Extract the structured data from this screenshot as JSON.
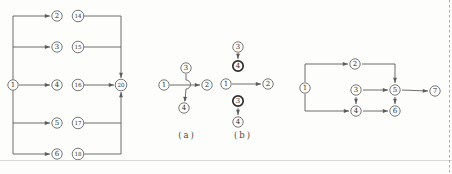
{
  "figure": {
    "width": 452,
    "height": 174,
    "bg": "#fdfdfc",
    "ink": "#5c5c5c",
    "node_stroke": "#6a6a6a",
    "bold_stroke": "#2e2e2e",
    "node_fill": "#fdfdfc",
    "text_color": "#333333",
    "rule_color": "#d8d8d8",
    "dash_color": "#a8a8a8"
  },
  "labels": {
    "a": "(a)",
    "b": "(b)"
  },
  "diagrams": {
    "fan": {
      "nodes": [
        {
          "label": "1",
          "x": 13,
          "y": 85
        },
        {
          "label": "2",
          "x": 57,
          "y": 16
        },
        {
          "label": "3",
          "x": 57,
          "y": 47
        },
        {
          "label": "4",
          "x": 57,
          "y": 85
        },
        {
          "label": "5",
          "x": 57,
          "y": 123
        },
        {
          "label": "6",
          "x": 57,
          "y": 154
        },
        {
          "label": "14",
          "x": 78,
          "y": 16
        },
        {
          "label": "15",
          "x": 78,
          "y": 47
        },
        {
          "label": "16",
          "x": 78,
          "y": 85
        },
        {
          "label": "17",
          "x": 78,
          "y": 123
        },
        {
          "label": "18",
          "x": 78,
          "y": 154
        },
        {
          "label": "20",
          "x": 121,
          "y": 85
        }
      ],
      "edges": [
        {
          "points": [
            [
              13,
              16
            ],
            [
              13,
              154
            ]
          ]
        },
        {
          "points": [
            [
              13,
              16
            ],
            [
              50,
              16
            ]
          ],
          "arrow": true
        },
        {
          "points": [
            [
              13,
              47
            ],
            [
              50,
              47
            ]
          ],
          "arrow": true
        },
        {
          "points": [
            [
              19,
              85
            ],
            [
              50,
              85
            ]
          ],
          "arrow": true
        },
        {
          "points": [
            [
              13,
              123
            ],
            [
              50,
              123
            ]
          ],
          "arrow": true
        },
        {
          "points": [
            [
              13,
              154
            ],
            [
              50,
              154
            ]
          ],
          "arrow": true
        },
        {
          "points": [
            [
              84,
              16
            ],
            [
              121,
              16
            ],
            [
              121,
              78
            ]
          ],
          "arrow": true
        },
        {
          "points": [
            [
              84,
              47
            ],
            [
              121,
              47
            ]
          ]
        },
        {
          "points": [
            [
              84,
              85
            ],
            [
              114,
              85
            ]
          ],
          "arrow": true
        },
        {
          "points": [
            [
              84,
              123
            ],
            [
              121,
              123
            ]
          ]
        },
        {
          "points": [
            [
              84,
              154
            ],
            [
              121,
              154
            ],
            [
              121,
              92
            ]
          ],
          "arrow": true
        }
      ]
    },
    "cross_a": {
      "nodes": [
        {
          "label": "1",
          "x": 164,
          "y": 85
        },
        {
          "label": "2",
          "x": 207,
          "y": 85
        },
        {
          "label": "3",
          "x": 186,
          "y": 68
        },
        {
          "label": "4",
          "x": 184,
          "y": 108
        }
      ],
      "edges": [
        {
          "points": [
            [
              170,
              85
            ],
            [
              200,
              85
            ]
          ],
          "arrow": true
        },
        {
          "d": "M186,74 L186,80 A4.5,4.5 0 0 1 186,89 L185,101",
          "arrow": {
            "x": 184.8,
            "y": 102,
            "angle": 93
          }
        }
      ]
    },
    "cross_b": {
      "nodes": [
        {
          "label": "3",
          "x": 238,
          "y": 47
        },
        {
          "label": "4",
          "x": 238,
          "y": 66,
          "bold": true
        },
        {
          "label": "1",
          "x": 226,
          "y": 84
        },
        {
          "label": "2",
          "x": 268,
          "y": 84
        },
        {
          "label": "3",
          "x": 238,
          "y": 101,
          "bold": true
        },
        {
          "label": "4",
          "x": 238,
          "y": 122
        }
      ],
      "edges": [
        {
          "points": [
            [
              238,
              53
            ],
            [
              238,
              59
            ]
          ],
          "arrow": true
        },
        {
          "points": [
            [
              232,
              84
            ],
            [
              261,
              84
            ]
          ],
          "arrow": true
        },
        {
          "points": [
            [
              238,
              108
            ],
            [
              238,
              115
            ]
          ],
          "arrow": true
        }
      ]
    },
    "network": {
      "nodes": [
        {
          "label": "1",
          "x": 305,
          "y": 88
        },
        {
          "label": "2",
          "x": 355,
          "y": 64
        },
        {
          "label": "3",
          "x": 356,
          "y": 90
        },
        {
          "label": "4",
          "x": 356,
          "y": 111
        },
        {
          "label": "5",
          "x": 395,
          "y": 90
        },
        {
          "label": "6",
          "x": 395,
          "y": 111
        },
        {
          "label": "7",
          "x": 435,
          "y": 91
        }
      ],
      "edges": [
        {
          "points": [
            [
              305,
              82
            ],
            [
              305,
              64
            ],
            [
              348,
              64
            ]
          ],
          "arrow": true
        },
        {
          "points": [
            [
              362,
              64
            ],
            [
              395,
              64
            ],
            [
              395,
              83
            ]
          ],
          "arrow": true
        },
        {
          "points": [
            [
              305,
              94
            ],
            [
              305,
              111
            ],
            [
              349,
              111
            ]
          ],
          "arrow": true
        },
        {
          "points": [
            [
              363,
              90
            ],
            [
              388,
              90
            ]
          ],
          "arrow": true
        },
        {
          "points": [
            [
              356,
              97
            ],
            [
              356,
              104
            ]
          ],
          "arrow": true
        },
        {
          "points": [
            [
              363,
              111
            ],
            [
              388,
              111
            ]
          ],
          "arrow": true
        },
        {
          "points": [
            [
              395,
              97
            ],
            [
              395,
              104
            ]
          ],
          "arrow": true
        },
        {
          "points": [
            [
              402,
              90
            ],
            [
              428,
              91
            ]
          ],
          "arrow": true
        }
      ]
    }
  },
  "decorations": {
    "bottom_rule": {
      "y": 160.5,
      "x1": 0,
      "x2": 452
    },
    "right_dashed_border": {
      "x": 449.5,
      "y1": 0,
      "y2": 174
    }
  },
  "sublabel_positions": {
    "a": {
      "x": 187,
      "y": 135
    },
    "b": {
      "x": 243,
      "y": 135
    }
  }
}
